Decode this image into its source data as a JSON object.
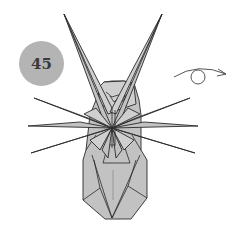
{
  "step": {
    "number": "45"
  },
  "symbols": {
    "turn_over": {
      "icon": "turn-over-arrow-icon",
      "meaning": "turn model over"
    }
  },
  "colors": {
    "paper": "#c2c2c2",
    "badge": "#b4b4b4",
    "line": "#2a2a2a",
    "background": "#ffffff"
  }
}
